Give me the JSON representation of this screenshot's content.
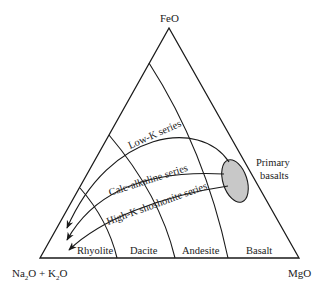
{
  "diagram": {
    "type": "AFM ternary diagram",
    "vertices": {
      "top": "FeO",
      "bottom_left_parts": [
        "Na",
        "2",
        "O + K",
        "2",
        "O"
      ],
      "bottom_left": "Na2O + K2O",
      "bottom_right": "MgO"
    },
    "rock_fields": [
      "Rhyolite",
      "Dacite",
      "Andesite",
      "Basalt"
    ],
    "source": {
      "label_line1": "Primary",
      "label_line2": "basalts",
      "fill": "#c8c8c8"
    },
    "series": [
      {
        "name": "Low-K series"
      },
      {
        "name": "Calc-alkaline series"
      },
      {
        "name": "High-K shoshonite series"
      }
    ],
    "colors": {
      "line": "#1a1a1a",
      "ellipse_fill": "#c8c8c8",
      "background": "#ffffff"
    }
  }
}
